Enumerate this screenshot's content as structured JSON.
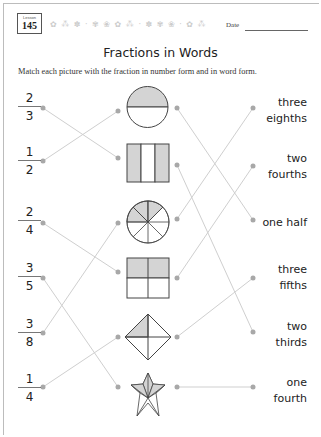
{
  "header": {
    "lesson_label": "Lesson",
    "lesson_number": "145",
    "decoration": "✿ ⁂ ✽ · ✾ ❀ ✿ ⁂ · ✽ ✾ ❀ · ✿ ⁂",
    "date_label": "Date"
  },
  "title": "Fractions in Words",
  "instructions": "Match each picture with the fraction in number form and in word form.",
  "fractions": [
    {
      "numerator": "2",
      "denominator": "3"
    },
    {
      "numerator": "1",
      "denominator": "2"
    },
    {
      "numerator": "2",
      "denominator": "4"
    },
    {
      "numerator": "3",
      "denominator": "5"
    },
    {
      "numerator": "3",
      "denominator": "8"
    },
    {
      "numerator": "1",
      "denominator": "4"
    }
  ],
  "pictures": [
    {
      "shape": "circle-half-shaded",
      "represents": "1/2"
    },
    {
      "shape": "rectangle-thirds-two-shaded",
      "represents": "2/3"
    },
    {
      "shape": "circle-eighths-three-shaded",
      "represents": "3/8"
    },
    {
      "shape": "square-quarters-two-shaded",
      "represents": "2/4"
    },
    {
      "shape": "diamond-quarters-one-shaded",
      "represents": "1/4"
    },
    {
      "shape": "star-fifths-three-shaded",
      "represents": "3/5"
    }
  ],
  "words": [
    {
      "line1": "three",
      "line2": "eighths"
    },
    {
      "line1": "two",
      "line2": "fourths"
    },
    {
      "line1": "one half",
      "line2": ""
    },
    {
      "line1": "three",
      "line2": "fifths"
    },
    {
      "line1": "two",
      "line2": "thirds"
    },
    {
      "line1": "one",
      "line2": "fourth"
    }
  ],
  "colors": {
    "shade": "#d4d4d4",
    "outline": "#444444",
    "connector": "#cfcfcf",
    "dot": "#a8a8a8"
  }
}
